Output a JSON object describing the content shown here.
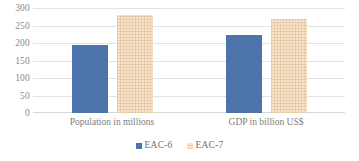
{
  "chart_data": {
    "type": "bar",
    "title": "",
    "subtitle": "",
    "xlabel": "",
    "ylabel": "",
    "categories": [
      "Population in millions",
      "GDP in billion US$"
    ],
    "series": [
      {
        "name": "EAC-6",
        "color": "#4c73aa",
        "values": [
          197,
          225
        ]
      },
      {
        "name": "EAC-7",
        "color": "#f6e3ca",
        "values": [
          283,
          271
        ]
      }
    ],
    "yticks": [
      300,
      250,
      200,
      150,
      100,
      50,
      0
    ],
    "ylim": [
      0,
      300
    ],
    "grid": true,
    "grid_axis": "y",
    "legend": [
      "EAC-6",
      "EAC-7"
    ],
    "legend_position": "bottom-center",
    "plot_background": "#ffffff",
    "gridline_color": "#e3e3e3",
    "tick_label_color": "#8a8a8a"
  }
}
